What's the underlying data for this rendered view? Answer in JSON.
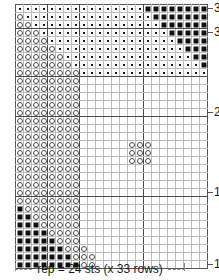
{
  "chart": {
    "title": "",
    "columns": 24,
    "rows": 33,
    "repeat_caption": "rep = 24 sts (x 33 rows)",
    "row_labels": [
      {
        "row": 33,
        "text": "33"
      },
      {
        "row": 30,
        "text": "30"
      },
      {
        "row": 20,
        "text": "20"
      },
      {
        "row": 10,
        "text": "10"
      },
      {
        "row": 1,
        "text": "1"
      }
    ],
    "legend_symbols": [
      {
        "key": "dot",
        "name": "dot-symbol",
        "label": "·"
      },
      {
        "key": "circle",
        "name": "circle-symbol",
        "label": "○"
      },
      {
        "key": "square",
        "name": "square-symbol",
        "label": "■"
      }
    ],
    "colors": {
      "grid_line": "#bdbdbd",
      "frame_line": "#555555",
      "repeat_line": "#4a4a4a",
      "symbol_dark": "#111111",
      "symbol_outline": "#4a4a4a",
      "background": "#ffffff",
      "caption_dash": "#8a8a8a"
    },
    "repeat_dividers": {
      "vertical_after_columns": [
        4,
        8,
        16
      ],
      "horizontal_after_rows_from_top": [
        3,
        9,
        14,
        24
      ]
    },
    "cells": [
      [
        "d",
        "d",
        "d",
        "d",
        "d",
        "d",
        "d",
        "d",
        "d",
        "d",
        "d",
        "d",
        "d",
        "d",
        "d",
        "d",
        "s",
        "s",
        "s",
        "s",
        "s",
        "s",
        "s",
        "s"
      ],
      [
        "c",
        "d",
        "d",
        "d",
        "d",
        "d",
        "d",
        "d",
        "d",
        "d",
        "d",
        "d",
        "d",
        "d",
        "d",
        "d",
        "d",
        "s",
        "s",
        "s",
        "s",
        "s",
        "s",
        "s"
      ],
      [
        "c",
        "c",
        "d",
        "d",
        "d",
        "d",
        "d",
        "d",
        "d",
        "d",
        "d",
        "d",
        "d",
        "d",
        "d",
        "d",
        "d",
        "d",
        "s",
        "s",
        "s",
        "s",
        "s",
        "s"
      ],
      [
        "c",
        "c",
        "c",
        "d",
        "d",
        "d",
        "d",
        "d",
        "d",
        "d",
        "d",
        "d",
        "d",
        "d",
        "d",
        "d",
        "d",
        "d",
        "d",
        "s",
        "s",
        "s",
        "s",
        "s"
      ],
      [
        "c",
        "c",
        "c",
        "c",
        "d",
        "d",
        "d",
        "d",
        "d",
        "d",
        "d",
        "d",
        "d",
        "d",
        "d",
        "d",
        "d",
        "d",
        "d",
        "d",
        "s",
        "s",
        "s",
        "s"
      ],
      [
        "c",
        "c",
        "c",
        "c",
        "c",
        "d",
        "d",
        "d",
        "d",
        "d",
        "d",
        "d",
        "d",
        "d",
        "d",
        "d",
        "d",
        "d",
        "d",
        "d",
        "d",
        "s",
        "s",
        "s"
      ],
      [
        "c",
        "c",
        "c",
        "c",
        "c",
        "c",
        "d",
        "d",
        "d",
        "d",
        "d",
        "d",
        "d",
        "d",
        "d",
        "d",
        "d",
        "d",
        "d",
        "d",
        "d",
        "d",
        "s",
        "s"
      ],
      [
        "c",
        "c",
        "c",
        "c",
        "c",
        "c",
        "c",
        "d",
        "d",
        "d",
        "d",
        "d",
        "d",
        "d",
        "d",
        "d",
        "d",
        "d",
        "d",
        "d",
        "d",
        "d",
        "d",
        "s"
      ],
      [
        "c",
        "c",
        "c",
        "c",
        "c",
        "c",
        "c",
        "c",
        "d",
        "d",
        "d",
        "d",
        "d",
        "d",
        "d",
        "d",
        "d",
        "d",
        "d",
        "d",
        "d",
        "d",
        "d",
        "d"
      ],
      [
        "c",
        "c",
        "c",
        "c",
        "c",
        "c",
        "c",
        "c",
        "e",
        "e",
        "e",
        "e",
        "e",
        "e",
        "e",
        "e",
        "e",
        "e",
        "e",
        "e",
        "e",
        "e",
        "e",
        "e"
      ],
      [
        "c",
        "c",
        "c",
        "c",
        "c",
        "c",
        "c",
        "c",
        "e",
        "e",
        "e",
        "e",
        "e",
        "e",
        "e",
        "e",
        "e",
        "e",
        "e",
        "e",
        "e",
        "e",
        "e",
        "e"
      ],
      [
        "c",
        "c",
        "c",
        "c",
        "c",
        "c",
        "c",
        "c",
        "e",
        "e",
        "e",
        "e",
        "e",
        "e",
        "e",
        "e",
        "e",
        "e",
        "e",
        "e",
        "e",
        "e",
        "e",
        "e"
      ],
      [
        "c",
        "c",
        "c",
        "c",
        "c",
        "c",
        "c",
        "c",
        "e",
        "e",
        "e",
        "e",
        "e",
        "e",
        "e",
        "e",
        "e",
        "e",
        "e",
        "e",
        "e",
        "e",
        "e",
        "e"
      ],
      [
        "c",
        "c",
        "c",
        "c",
        "c",
        "c",
        "c",
        "c",
        "e",
        "e",
        "e",
        "e",
        "e",
        "e",
        "e",
        "e",
        "e",
        "e",
        "e",
        "e",
        "e",
        "e",
        "e",
        "e"
      ],
      [
        "c",
        "c",
        "c",
        "c",
        "c",
        "c",
        "c",
        "c",
        "e",
        "e",
        "e",
        "e",
        "e",
        "e",
        "e",
        "e",
        "e",
        "e",
        "e",
        "e",
        "e",
        "e",
        "e",
        "e"
      ],
      [
        "c",
        "c",
        "c",
        "c",
        "c",
        "c",
        "c",
        "c",
        "e",
        "e",
        "e",
        "e",
        "e",
        "e",
        "e",
        "e",
        "e",
        "e",
        "e",
        "e",
        "e",
        "e",
        "e",
        "e"
      ],
      [
        "c",
        "c",
        "c",
        "c",
        "c",
        "c",
        "c",
        "c",
        "e",
        "e",
        "e",
        "e",
        "e",
        "e",
        "e",
        "e",
        "e",
        "e",
        "e",
        "e",
        "e",
        "e",
        "e",
        "e"
      ],
      [
        "c",
        "c",
        "c",
        "c",
        "c",
        "c",
        "c",
        "c",
        "e",
        "e",
        "e",
        "e",
        "e",
        "e",
        "c",
        "c",
        "c",
        "e",
        "e",
        "e",
        "e",
        "e",
        "e",
        "e"
      ],
      [
        "c",
        "c",
        "c",
        "c",
        "c",
        "c",
        "c",
        "c",
        "e",
        "e",
        "e",
        "e",
        "e",
        "e",
        "c",
        "c",
        "c",
        "e",
        "e",
        "e",
        "e",
        "e",
        "e",
        "e"
      ],
      [
        "c",
        "c",
        "c",
        "c",
        "c",
        "c",
        "c",
        "c",
        "e",
        "e",
        "e",
        "e",
        "e",
        "e",
        "c",
        "c",
        "c",
        "e",
        "e",
        "e",
        "e",
        "e",
        "e",
        "e"
      ],
      [
        "c",
        "c",
        "c",
        "c",
        "c",
        "c",
        "c",
        "c",
        "e",
        "e",
        "e",
        "e",
        "e",
        "e",
        "e",
        "e",
        "e",
        "e",
        "e",
        "e",
        "e",
        "e",
        "e",
        "e"
      ],
      [
        "c",
        "c",
        "c",
        "c",
        "c",
        "c",
        "c",
        "c",
        "e",
        "e",
        "e",
        "e",
        "e",
        "e",
        "e",
        "e",
        "e",
        "e",
        "e",
        "e",
        "e",
        "e",
        "e",
        "e"
      ],
      [
        "c",
        "c",
        "c",
        "c",
        "c",
        "c",
        "c",
        "c",
        "e",
        "e",
        "e",
        "e",
        "e",
        "e",
        "e",
        "e",
        "e",
        "e",
        "e",
        "e",
        "e",
        "e",
        "e",
        "e"
      ],
      [
        "c",
        "c",
        "c",
        "c",
        "c",
        "c",
        "c",
        "c",
        "e",
        "e",
        "e",
        "e",
        "e",
        "e",
        "e",
        "e",
        "e",
        "e",
        "e",
        "e",
        "e",
        "e",
        "e",
        "e"
      ],
      [
        "c",
        "c",
        "c",
        "c",
        "c",
        "c",
        "c",
        "c",
        "e",
        "e",
        "e",
        "e",
        "e",
        "e",
        "e",
        "e",
        "e",
        "e",
        "e",
        "e",
        "e",
        "e",
        "e",
        "e"
      ],
      [
        "s",
        "c",
        "c",
        "c",
        "c",
        "c",
        "c",
        "c",
        "e",
        "e",
        "e",
        "e",
        "e",
        "e",
        "e",
        "e",
        "e",
        "e",
        "e",
        "e",
        "e",
        "e",
        "e",
        "e"
      ],
      [
        "s",
        "s",
        "c",
        "c",
        "c",
        "c",
        "c",
        "c",
        "e",
        "e",
        "e",
        "e",
        "e",
        "e",
        "e",
        "e",
        "e",
        "e",
        "e",
        "e",
        "e",
        "e",
        "e",
        "e"
      ],
      [
        "s",
        "s",
        "s",
        "c",
        "c",
        "c",
        "c",
        "c",
        "e",
        "e",
        "e",
        "e",
        "e",
        "e",
        "e",
        "e",
        "e",
        "e",
        "e",
        "e",
        "e",
        "e",
        "e",
        "e"
      ],
      [
        "s",
        "s",
        "s",
        "s",
        "c",
        "c",
        "c",
        "c",
        "e",
        "e",
        "e",
        "e",
        "e",
        "e",
        "e",
        "e",
        "e",
        "e",
        "e",
        "e",
        "e",
        "e",
        "e",
        "e"
      ],
      [
        "s",
        "s",
        "s",
        "s",
        "s",
        "c",
        "c",
        "c",
        "e",
        "e",
        "e",
        "e",
        "e",
        "e",
        "e",
        "e",
        "e",
        "e",
        "e",
        "e",
        "e",
        "e",
        "e",
        "e"
      ],
      [
        "s",
        "s",
        "s",
        "s",
        "s",
        "s",
        "c",
        "c",
        "c",
        "e",
        "e",
        "e",
        "e",
        "e",
        "e",
        "e",
        "e",
        "e",
        "e",
        "e",
        "e",
        "e",
        "e",
        "e"
      ],
      [
        "s",
        "s",
        "s",
        "s",
        "s",
        "s",
        "s",
        "c",
        "c",
        "c",
        "e",
        "e",
        "e",
        "e",
        "e",
        "e",
        "e",
        "e",
        "e",
        "e",
        "e",
        "e",
        "e",
        "e"
      ],
      [
        "s",
        "s",
        "s",
        "s",
        "s",
        "s",
        "s",
        "s",
        "c",
        "c",
        "e",
        "e",
        "e",
        "e",
        "e",
        "e",
        "e",
        "e",
        "e",
        "e",
        "e",
        "e",
        "e",
        "e"
      ]
    ]
  }
}
